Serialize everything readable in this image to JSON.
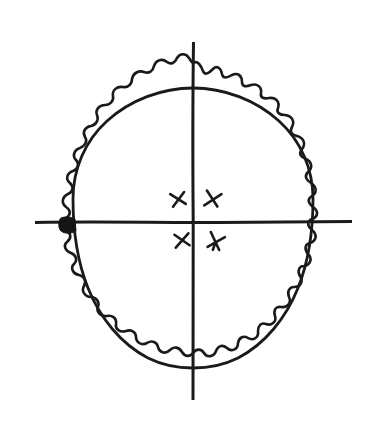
{
  "figure": {
    "background_color": "#ffffff",
    "ink_color": "#1a1a1a",
    "fill_color": "#151515",
    "canvas": {
      "width": 376,
      "height": 430
    },
    "shapes": {
      "outer_contour": {
        "name": "scalloped-outer-margin",
        "description": "crenulated ruffled border surrounding the ovoid body",
        "scallop_count": 30,
        "bounds": {
          "x_min": 58,
          "x_max": 332,
          "y_min": 62,
          "y_max": 388
        }
      },
      "inner_contour": {
        "name": "ovoid-body-outline",
        "description": "smooth egg-shaped inner outline",
        "bounds": {
          "x_min": 73,
          "x_max": 313,
          "y_min": 88,
          "y_max": 368
        }
      },
      "vertical_axis": {
        "name": "vertical-axis",
        "x": 193,
        "y_start": 42,
        "y_end": 400
      },
      "horizontal_axis": {
        "name": "horizontal-axis",
        "y": 222,
        "x_start": 35,
        "x_end": 352
      },
      "dark_wedge": {
        "name": "filled-wedge-marker",
        "description": "solid dark triangular blotch where the horizontal axis meets the left edge of the ovoid body",
        "center": {
          "x": 68,
          "y": 226
        }
      }
    },
    "marks": [
      {
        "id": "mark-upper-left",
        "glyph": "x",
        "quadrant": "upper-left",
        "x": 178,
        "y": 199,
        "rotation": -8,
        "size": 15
      },
      {
        "id": "mark-upper-right",
        "glyph": "x",
        "quadrant": "upper-right",
        "x": 212,
        "y": 199,
        "rotation": 14,
        "size": 16
      },
      {
        "id": "mark-lower-left",
        "glyph": "x",
        "quadrant": "lower-left",
        "x": 182,
        "y": 240,
        "rotation": -6,
        "size": 15
      },
      {
        "id": "mark-lower-right",
        "glyph": "x",
        "quadrant": "lower-right",
        "x": 215,
        "y": 241,
        "rotation": 20,
        "size": 16
      }
    ],
    "quadrants": [
      {
        "name": "upper-left",
        "label": ""
      },
      {
        "name": "upper-right",
        "label": ""
      },
      {
        "name": "lower-left",
        "label": ""
      },
      {
        "name": "lower-right",
        "label": ""
      }
    ]
  }
}
